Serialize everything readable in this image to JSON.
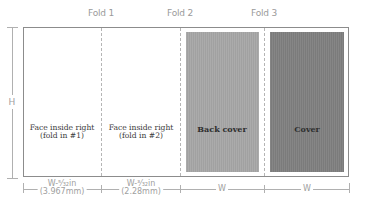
{
  "folds": [
    {
      "label": "Fold 1"
    },
    {
      "label": "Fold 2"
    },
    {
      "label": "Fold 3"
    }
  ],
  "panels": [
    {
      "line1": "Face inside right",
      "line2": "(fold in #1)"
    },
    {
      "line1": "Face inside right",
      "line2": "(fold in #2)"
    },
    {
      "label": "Back cover",
      "color": "#a6a6a6"
    },
    {
      "label": "Cover",
      "color": "#808080"
    }
  ],
  "dimensions": {
    "height_label": "H",
    "widths": [
      {
        "line1": "W-⁵⁄₃₂in",
        "line2": "(3.967mm)"
      },
      {
        "line1": "W-³⁄₃₂in",
        "line2": "(2.28mm)"
      },
      {
        "line1": "W"
      },
      {
        "line1": "W"
      }
    ]
  }
}
